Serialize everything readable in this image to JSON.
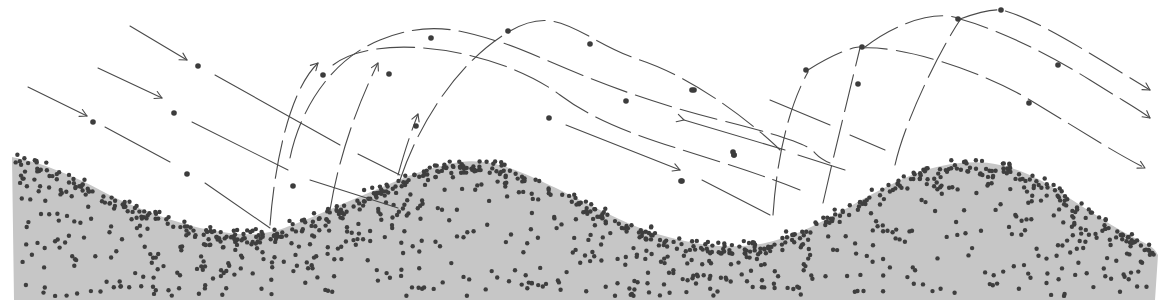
{
  "figure": {
    "width": 1168,
    "height": 305,
    "colors": {
      "background": "#ffffff",
      "sand_bed": "#c6c6c6",
      "grain": "#3c3c3c",
      "trajectory_line": "#4a4a4a"
    }
  },
  "sand_bed": {
    "surface": [
      [
        12,
        157
      ],
      [
        40,
        164
      ],
      [
        80,
        180
      ],
      [
        120,
        200
      ],
      [
        160,
        216
      ],
      [
        200,
        228
      ],
      [
        240,
        234
      ],
      [
        270,
        232
      ],
      [
        300,
        222
      ],
      [
        340,
        205
      ],
      [
        380,
        188
      ],
      [
        420,
        172
      ],
      [
        460,
        162
      ],
      [
        490,
        163
      ],
      [
        520,
        172
      ],
      [
        560,
        190
      ],
      [
        600,
        210
      ],
      [
        640,
        228
      ],
      [
        680,
        240
      ],
      [
        720,
        246
      ],
      [
        760,
        244
      ],
      [
        800,
        232
      ],
      [
        840,
        212
      ],
      [
        880,
        190
      ],
      [
        920,
        172
      ],
      [
        960,
        163
      ],
      [
        1000,
        165
      ],
      [
        1040,
        180
      ],
      [
        1080,
        205
      ],
      [
        1120,
        230
      ],
      [
        1150,
        246
      ],
      [
        1158,
        255
      ]
    ],
    "bottom_y": 300,
    "left_x": 14,
    "right_x": 1155,
    "grain_count_surface": 420,
    "grain_count_interior": 720,
    "grain_radius": 2.2
  },
  "incoming_trajectories": [
    {
      "id": "incoming-1",
      "segments": [
        [
          [
            28,
            87
          ],
          [
            87,
            116
          ]
        ],
        [
          [
            105,
            127
          ],
          [
            170,
            162
          ]
        ],
        [
          [
            205,
            183
          ],
          [
            270,
            228
          ]
        ]
      ],
      "arrow_at": [
        87,
        116
      ],
      "grains": [
        [
          93,
          122
        ],
        [
          187,
          174
        ]
      ]
    },
    {
      "id": "incoming-2",
      "segments": [
        [
          [
            98,
            68
          ],
          [
            162,
            98
          ]
        ],
        [
          [
            192,
            122
          ],
          [
            288,
            170
          ]
        ],
        [
          [
            310,
            180
          ],
          [
            398,
            208
          ]
        ]
      ],
      "arrow_at": [
        162,
        98
      ],
      "grains": [
        [
          174,
          113
        ],
        [
          293,
          186
        ]
      ]
    },
    {
      "id": "incoming-3",
      "segments": [
        [
          [
            130,
            26
          ],
          [
            187,
            60
          ]
        ],
        [
          [
            215,
            75
          ],
          [
            340,
            145
          ]
        ],
        [
          [
            358,
            154
          ],
          [
            400,
            175
          ]
        ]
      ],
      "arrow_at": [
        187,
        60
      ],
      "grains": [
        [
          198,
          66
        ]
      ]
    }
  ],
  "ejection_trajectories": [
    {
      "id": "hop-1",
      "path": "M270 225 C 275 160, 290 90, 318 63",
      "arrow_at": [
        318,
        63
      ],
      "grains": [
        [
          323,
          75
        ]
      ]
    },
    {
      "id": "hop-2",
      "path": "M330 210 C 340 150, 360 100, 378 63",
      "arrow_at": [
        378,
        63
      ],
      "grains": [
        [
          389,
          74
        ]
      ]
    },
    {
      "id": "hop-3",
      "path": "M398 175 C 405 150, 410 135, 418 114",
      "arrow_at": [
        418,
        114
      ],
      "grains": [
        [
          416,
          126
        ]
      ]
    },
    {
      "id": "long-1",
      "path": "M333 65 C 380 30, 500 50, 560 95 S 700 150, 800 190",
      "grains": [
        [
          549,
          118
        ],
        [
          681,
          181
        ]
      ]
    },
    {
      "id": "long-2",
      "path": "M290 158 C 300 110, 330 60, 380 40 S 460 30, 500 42 S 600 90, 720 120 S 800 150, 830 163",
      "grains": [
        [
          431,
          38
        ],
        [
          590,
          44
        ],
        [
          626,
          101
        ],
        [
          734,
          155
        ]
      ]
    },
    {
      "id": "long-3",
      "path": "M400 180 C 420 120, 460 60, 510 31 S 580 40, 640 60 S 760 130, 780 150",
      "grains": [
        [
          508,
          31
        ],
        [
          692,
          90
        ],
        [
          733,
          152
        ]
      ]
    }
  ],
  "right_hop_trajectories": [
    {
      "id": "right-hop-1",
      "path": "M773 215 C 778 140, 795 95, 808 72",
      "grains": [
        [
          806,
          70
        ]
      ]
    },
    {
      "id": "right-hop-2",
      "path": "M823 203 C 835 150, 845 110, 860 48",
      "grains": [
        [
          858,
          84
        ]
      ]
    },
    {
      "id": "right-hop-3",
      "path": "M895 165 C 905 120, 940 50, 960 20",
      "grains": [
        [
          958,
          19
        ]
      ]
    },
    {
      "id": "right-long-1",
      "path": "M808 70 C 840 50, 860 45, 861 48 C 900 45, 980 70, 1030 100 S 1110 150, 1145 168",
      "arrow_at": [
        1145,
        168
      ],
      "grains": [
        [
          862,
          47
        ],
        [
          1029,
          103
        ]
      ]
    },
    {
      "id": "right-long-2",
      "path": "M865 47 C 900 20, 940 10, 960 19 C 1000 30, 1050 55, 1090 80 S 1140 110, 1150 118",
      "arrow_at": [
        1150,
        118
      ],
      "grains": [
        [
          1058,
          65
        ]
      ]
    },
    {
      "id": "right-long-3",
      "path": "M960 19 C 990 8, 1000 10, 1002 10 C 1040 20, 1100 60, 1150 90",
      "arrow_at": [
        1150,
        90
      ],
      "grains": [
        [
          1001,
          10
        ]
      ]
    }
  ],
  "bridge_segments": [
    {
      "id": "mid-1",
      "segments": [
        [
          [
            684,
            120
          ],
          [
            785,
            150
          ]
        ],
        [
          [
            798,
            155
          ],
          [
            845,
            170
          ]
        ]
      ],
      "arrow_at": [
        684,
        120
      ],
      "grains": [
        [
          694,
          90
        ]
      ]
    },
    {
      "id": "mid-2",
      "segments": [
        [
          [
            566,
            125
          ],
          [
            680,
            170
          ]
        ],
        [
          [
            702,
            180
          ],
          [
            770,
            215
          ]
        ]
      ],
      "arrow_at": [
        680,
        170
      ],
      "grains": [
        [
          682,
          181
        ],
        [
          734,
          155
        ]
      ]
    },
    {
      "id": "mid-3",
      "segments": [
        [
          [
            770,
            100
          ],
          [
            830,
            125
          ]
        ],
        [
          [
            850,
            135
          ],
          [
            885,
            150
          ]
        ]
      ],
      "grains": []
    }
  ]
}
